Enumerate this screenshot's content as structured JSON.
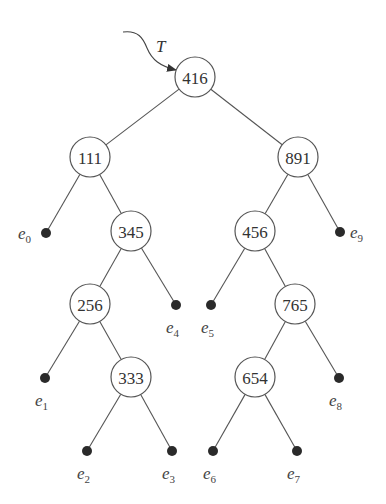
{
  "diagram": {
    "type": "binary-search-tree",
    "pointer": {
      "label": "T",
      "target": "416"
    },
    "nodes": [
      {
        "id": "n416",
        "label": "416",
        "x": 195,
        "y": 77
      },
      {
        "id": "n111",
        "label": "111",
        "x": 90,
        "y": 157
      },
      {
        "id": "n891",
        "label": "891",
        "x": 298,
        "y": 157
      },
      {
        "id": "n345",
        "label": "345",
        "x": 131,
        "y": 231
      },
      {
        "id": "n456",
        "label": "456",
        "x": 255,
        "y": 231
      },
      {
        "id": "n256",
        "label": "256",
        "x": 90,
        "y": 304
      },
      {
        "id": "n765",
        "label": "765",
        "x": 295,
        "y": 304
      },
      {
        "id": "n333",
        "label": "333",
        "x": 131,
        "y": 377
      },
      {
        "id": "n654",
        "label": "654",
        "x": 255,
        "y": 377
      }
    ],
    "leaves": [
      {
        "id": "e0",
        "base": "e",
        "sub": "0",
        "x": 46,
        "y": 233
      },
      {
        "id": "e1",
        "base": "e",
        "sub": "1",
        "x": 45,
        "y": 378
      },
      {
        "id": "e2",
        "base": "e",
        "sub": "2",
        "x": 87,
        "y": 451
      },
      {
        "id": "e3",
        "base": "e",
        "sub": "3",
        "x": 172,
        "y": 451
      },
      {
        "id": "e4",
        "base": "e",
        "sub": "4",
        "x": 176,
        "y": 305
      },
      {
        "id": "e5",
        "base": "e",
        "sub": "5",
        "x": 211,
        "y": 305
      },
      {
        "id": "e6",
        "base": "e",
        "sub": "6",
        "x": 213,
        "y": 451
      },
      {
        "id": "e7",
        "base": "e",
        "sub": "7",
        "x": 297,
        "y": 451
      },
      {
        "id": "e8",
        "base": "e",
        "sub": "8",
        "x": 339,
        "y": 378
      },
      {
        "id": "e9",
        "base": "e",
        "sub": "9",
        "x": 340,
        "y": 232
      }
    ],
    "edges": [
      [
        "n416",
        "n111"
      ],
      [
        "n416",
        "n891"
      ],
      [
        "n111",
        "e0"
      ],
      [
        "n111",
        "n345"
      ],
      [
        "n345",
        "n256"
      ],
      [
        "n345",
        "e4"
      ],
      [
        "n256",
        "e1"
      ],
      [
        "n256",
        "n333"
      ],
      [
        "n333",
        "e2"
      ],
      [
        "n333",
        "e3"
      ],
      [
        "n891",
        "n456"
      ],
      [
        "n891",
        "e9"
      ],
      [
        "n456",
        "e5"
      ],
      [
        "n456",
        "n765"
      ],
      [
        "n765",
        "n654"
      ],
      [
        "n765",
        "e8"
      ],
      [
        "n654",
        "e6"
      ],
      [
        "n654",
        "e7"
      ]
    ],
    "inorder_keys": [
      "111",
      "256",
      "333",
      "345",
      "416",
      "456",
      "654",
      "765",
      "891"
    ]
  }
}
